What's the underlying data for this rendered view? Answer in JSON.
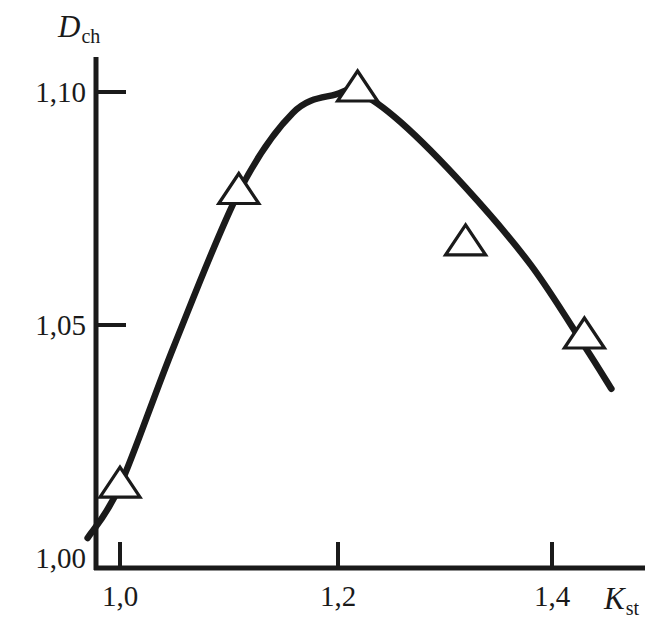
{
  "figure": {
    "background_color": "#ffffff",
    "ink_color": "#1a1a1a"
  },
  "axes": {
    "y_title_main": "D",
    "y_title_sub": "ch",
    "x_title_main": "K",
    "x_title_sub": "st",
    "y_ticks": [
      "1,10",
      "1,05",
      "1,00"
    ],
    "x_ticks": [
      "1,0",
      "1,2",
      "1,4"
    ]
  },
  "chart_data": {
    "type": "line",
    "title": "",
    "subtitle": "",
    "xlabel": "K_st",
    "ylabel": "D_ch",
    "xlim": [
      0.955,
      1.465
    ],
    "ylim": [
      1.0,
      1.1125
    ],
    "grid": false,
    "legend": null,
    "decimal_separator": ",",
    "axis_ticks": {
      "x": [
        1.0,
        1.2,
        1.4
      ],
      "x_labels": [
        "1,0",
        "1,2",
        "1,4"
      ],
      "y": [
        1.0,
        1.05,
        1.1
      ],
      "y_labels": [
        "1,00",
        "1,05",
        "1,10"
      ]
    },
    "series": [
      {
        "name": "D_ch(K_st)",
        "marker": "triangle-up-open",
        "line_color": "#1a1a1a",
        "line_width": 5,
        "x": [
          1.0,
          1.11,
          1.22,
          1.32,
          1.43
        ],
        "y": [
          1.015,
          1.078,
          1.1,
          1.067,
          1.047
        ]
      }
    ],
    "fitted_curve": {
      "description": "smooth trend line rising steeply from 1.004 at K_st=0.97, peaking at 1.100 near K_st=1.22, then falling almost linearly to 1.036 at K_st=1.455",
      "x": [
        0.97,
        1.0,
        1.05,
        1.11,
        1.16,
        1.2,
        1.22,
        1.26,
        1.32,
        1.38,
        1.43,
        1.455
      ],
      "y": [
        1.0043,
        1.0155,
        1.0455,
        1.0785,
        1.0955,
        1.0995,
        1.1,
        1.0935,
        1.0795,
        1.063,
        1.0455,
        1.0363
      ]
    }
  }
}
